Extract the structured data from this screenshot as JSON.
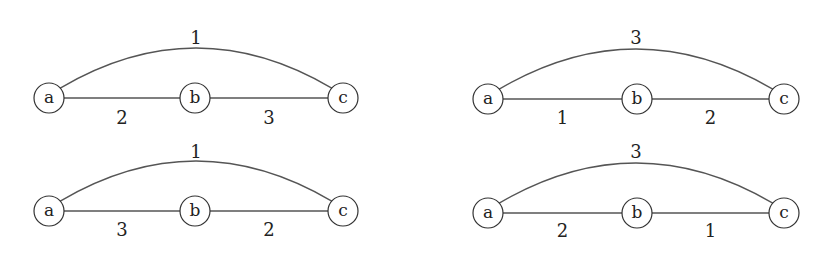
{
  "graphs": [
    {
      "id": "graph-top-left",
      "nodes": [
        "a",
        "b",
        "c"
      ],
      "edges": [
        {
          "from": "a",
          "to": "c",
          "weight": "1",
          "curved": true
        },
        {
          "from": "a",
          "to": "b",
          "weight": "2",
          "curved": false
        },
        {
          "from": "b",
          "to": "c",
          "weight": "3",
          "curved": false
        }
      ]
    },
    {
      "id": "graph-top-right",
      "nodes": [
        "a",
        "b",
        "c"
      ],
      "edges": [
        {
          "from": "a",
          "to": "c",
          "weight": "3",
          "curved": true
        },
        {
          "from": "a",
          "to": "b",
          "weight": "1",
          "curved": false
        },
        {
          "from": "b",
          "to": "c",
          "weight": "2",
          "curved": false
        }
      ]
    },
    {
      "id": "graph-bottom-left",
      "nodes": [
        "a",
        "b",
        "c"
      ],
      "edges": [
        {
          "from": "a",
          "to": "c",
          "weight": "1",
          "curved": true
        },
        {
          "from": "a",
          "to": "b",
          "weight": "3",
          "curved": false
        },
        {
          "from": "b",
          "to": "c",
          "weight": "2",
          "curved": false
        }
      ]
    },
    {
      "id": "graph-bottom-right",
      "nodes": [
        "a",
        "b",
        "c"
      ],
      "edges": [
        {
          "from": "a",
          "to": "c",
          "weight": "3",
          "curved": true
        },
        {
          "from": "a",
          "to": "b",
          "weight": "2",
          "curved": false
        },
        {
          "from": "b",
          "to": "c",
          "weight": "1",
          "curved": false
        }
      ]
    }
  ]
}
